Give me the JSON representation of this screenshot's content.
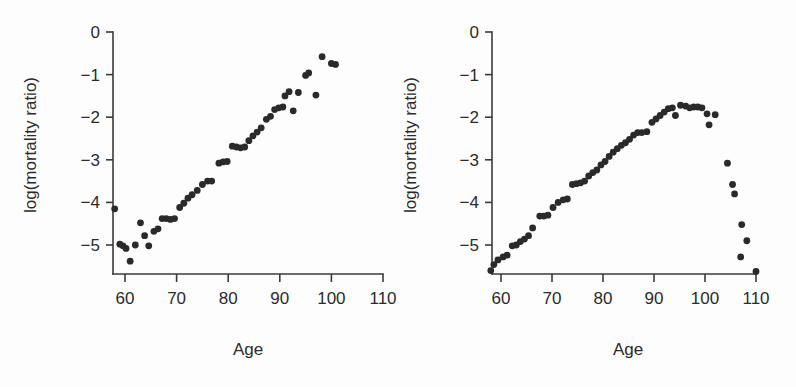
{
  "figure": {
    "background_color": "#fdfdfd",
    "ink_color": "#2b2b2b",
    "point_color": "#2a2a2a"
  },
  "panels": [
    {
      "id": "left",
      "xlabel": "Age",
      "ylabel": "log(mortality ratio)"
    },
    {
      "id": "right",
      "xlabel": "Age",
      "ylabel": "log(mortality ratio)"
    }
  ],
  "chart_data": [
    {
      "type": "scatter",
      "panel": "left",
      "title": "",
      "xlabel": "Age",
      "ylabel": "log(mortality ratio)",
      "xlim": [
        55,
        112
      ],
      "ylim": [
        -5.6,
        0.2
      ],
      "xticks": [
        60,
        70,
        80,
        90,
        100,
        110
      ],
      "yticks": [
        0,
        -1,
        -2,
        -3,
        -4,
        -5
      ],
      "xtick_labels": [
        "60",
        "70",
        "80",
        "90",
        "100",
        "110"
      ],
      "ytick_labels": [
        "0",
        "-1",
        "-2",
        "-3",
        "-4",
        "-5"
      ],
      "grid": false,
      "legend": null,
      "points": [
        [
          58.0,
          -4.15
        ],
        [
          59.0,
          -4.98
        ],
        [
          59.6,
          -5.02
        ],
        [
          60.2,
          -5.08
        ],
        [
          61.0,
          -5.38
        ],
        [
          62.0,
          -5.0
        ],
        [
          63.0,
          -4.48
        ],
        [
          63.8,
          -4.78
        ],
        [
          64.6,
          -5.02
        ],
        [
          65.6,
          -4.68
        ],
        [
          66.4,
          -4.62
        ],
        [
          67.2,
          -4.38
        ],
        [
          68.0,
          -4.38
        ],
        [
          68.8,
          -4.4
        ],
        [
          69.6,
          -4.38
        ],
        [
          70.6,
          -4.12
        ],
        [
          71.4,
          -4.02
        ],
        [
          72.2,
          -3.9
        ],
        [
          73.0,
          -3.82
        ],
        [
          74.0,
          -3.72
        ],
        [
          75.0,
          -3.58
        ],
        [
          76.0,
          -3.5
        ],
        [
          76.8,
          -3.5
        ],
        [
          78.2,
          -3.08
        ],
        [
          79.0,
          -3.05
        ],
        [
          79.8,
          -3.04
        ],
        [
          80.8,
          -2.68
        ],
        [
          81.6,
          -2.7
        ],
        [
          82.4,
          -2.72
        ],
        [
          83.2,
          -2.7
        ],
        [
          84.0,
          -2.55
        ],
        [
          84.8,
          -2.44
        ],
        [
          85.6,
          -2.35
        ],
        [
          86.4,
          -2.25
        ],
        [
          87.4,
          -2.05
        ],
        [
          88.2,
          -1.98
        ],
        [
          89.0,
          -1.82
        ],
        [
          89.8,
          -1.78
        ],
        [
          90.6,
          -1.76
        ],
        [
          91.0,
          -1.5
        ],
        [
          91.8,
          -1.4
        ],
        [
          92.6,
          -1.85
        ],
        [
          93.6,
          -1.42
        ],
        [
          95.0,
          -1.02
        ],
        [
          95.6,
          -0.96
        ],
        [
          97.0,
          -1.48
        ],
        [
          98.2,
          -0.58
        ],
        [
          100.0,
          -0.74
        ],
        [
          100.8,
          -0.76
        ]
      ]
    },
    {
      "type": "scatter",
      "panel": "right",
      "title": "",
      "xlabel": "Age",
      "ylabel": "log(mortality ratio)",
      "xlim": [
        55,
        112
      ],
      "ylim": [
        -5.7,
        0.2
      ],
      "xticks": [
        60,
        70,
        80,
        90,
        100,
        110
      ],
      "yticks": [
        0,
        -1,
        -2,
        -3,
        -4,
        -5
      ],
      "xtick_labels": [
        "60",
        "70",
        "80",
        "90",
        "100",
        "110"
      ],
      "ytick_labels": [
        "0",
        "-1",
        "-2",
        "-3",
        "-4",
        "-5"
      ],
      "grid": false,
      "legend": null,
      "points": [
        [
          58.0,
          -5.6
        ],
        [
          58.6,
          -5.46
        ],
        [
          59.4,
          -5.35
        ],
        [
          60.4,
          -5.28
        ],
        [
          61.2,
          -5.24
        ],
        [
          62.2,
          -5.02
        ],
        [
          63.0,
          -5.0
        ],
        [
          63.8,
          -4.92
        ],
        [
          64.6,
          -4.86
        ],
        [
          65.4,
          -4.78
        ],
        [
          66.2,
          -4.6
        ],
        [
          67.6,
          -4.32
        ],
        [
          68.4,
          -4.32
        ],
        [
          69.2,
          -4.3
        ],
        [
          70.2,
          -4.12
        ],
        [
          71.2,
          -4.0
        ],
        [
          72.2,
          -3.94
        ],
        [
          73.0,
          -3.92
        ],
        [
          74.0,
          -3.58
        ],
        [
          74.8,
          -3.56
        ],
        [
          75.6,
          -3.54
        ],
        [
          76.4,
          -3.5
        ],
        [
          77.2,
          -3.38
        ],
        [
          78.0,
          -3.3
        ],
        [
          78.8,
          -3.24
        ],
        [
          79.6,
          -3.12
        ],
        [
          80.4,
          -3.04
        ],
        [
          81.2,
          -2.92
        ],
        [
          82.0,
          -2.82
        ],
        [
          82.8,
          -2.74
        ],
        [
          83.6,
          -2.66
        ],
        [
          84.4,
          -2.6
        ],
        [
          85.2,
          -2.52
        ],
        [
          86.0,
          -2.42
        ],
        [
          86.8,
          -2.36
        ],
        [
          87.6,
          -2.36
        ],
        [
          88.6,
          -2.34
        ],
        [
          89.6,
          -2.12
        ],
        [
          90.4,
          -2.04
        ],
        [
          91.2,
          -1.96
        ],
        [
          92.0,
          -1.88
        ],
        [
          92.8,
          -1.8
        ],
        [
          93.6,
          -1.78
        ],
        [
          94.2,
          -1.96
        ],
        [
          95.2,
          -1.72
        ],
        [
          96.2,
          -1.74
        ],
        [
          97.0,
          -1.78
        ],
        [
          97.8,
          -1.76
        ],
        [
          98.6,
          -1.76
        ],
        [
          99.4,
          -1.78
        ],
        [
          100.4,
          -1.92
        ],
        [
          100.8,
          -2.18
        ],
        [
          102.0,
          -1.94
        ],
        [
          104.4,
          -3.08
        ],
        [
          105.4,
          -3.58
        ],
        [
          105.8,
          -3.8
        ],
        [
          107.2,
          -4.52
        ],
        [
          108.2,
          -4.9
        ],
        [
          107.0,
          -5.28
        ],
        [
          110.0,
          -5.62
        ]
      ]
    }
  ]
}
